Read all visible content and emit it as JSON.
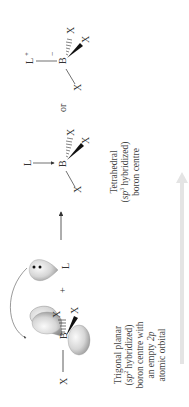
{
  "figure": {
    "orientation": "rotated -90deg",
    "colors": {
      "text": "#333333",
      "orbital_fill_light": "#f2f2f2",
      "orbital_fill_dark": "#9a9a9a",
      "progress_arrow": "#e6e6e6"
    },
    "reactant": {
      "atoms": {
        "boron": "B",
        "x_left": "X",
        "x_hash": "X",
        "x_wedge": "X"
      },
      "plus": "+",
      "ligand": "L",
      "lone_pair": "••",
      "caption": {
        "line1": "Trigonal planar",
        "line2_pre": "(",
        "line2_sp": "sp",
        "line2_sup": "2",
        "line2_post": " hybridized)",
        "line3": "boron centre with",
        "line4_pre": "an empty ",
        "line4_orbital": "2p",
        "line5": "atomic orbital"
      }
    },
    "product_dative": {
      "atoms": {
        "ligand": "L",
        "boron": "B",
        "x_hash": "X",
        "x_wedge": "X",
        "x_plain": "X"
      },
      "caption": {
        "line1": "Tetrahedral",
        "line2_pre": "(",
        "line2_sp": "sp",
        "line2_sup": "3",
        "line2_post": " hybridized)",
        "line3": "boron centre"
      }
    },
    "connector": "or",
    "product_ionic": {
      "atoms": {
        "ligand": "L",
        "ligand_charge": "+",
        "boron": "B",
        "boron_charge": "−",
        "x_hash": "X",
        "x_wedge": "X",
        "x_plain": "X"
      }
    }
  }
}
